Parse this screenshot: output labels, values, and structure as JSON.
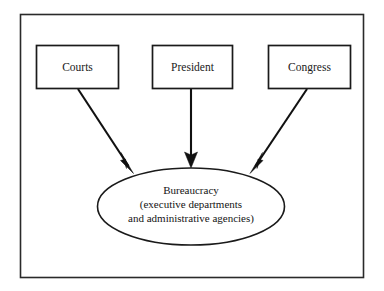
{
  "diagram": {
    "frame": {
      "name": "outer-border"
    },
    "nodes": [
      {
        "id": "courts",
        "label": "Courts",
        "shape": "rectangle",
        "x": 36,
        "y": 45,
        "width": 82,
        "height": 43
      },
      {
        "id": "president",
        "label": "President",
        "shape": "rectangle",
        "x": 152,
        "y": 45,
        "width": 80,
        "height": 43
      },
      {
        "id": "congress",
        "label": "Congress",
        "shape": "rectangle",
        "x": 268,
        "y": 45,
        "width": 82,
        "height": 43
      },
      {
        "id": "bureaucracy",
        "shape": "ellipse",
        "cx": 191,
        "cy": 206,
        "rx": 94,
        "ry": 39,
        "label_lines": [
          "Bureaucracy",
          "(executive departments",
          "and administrative agencies)"
        ]
      }
    ],
    "edges": [
      {
        "id": "courts-to-bureaucracy",
        "from": "courts",
        "to": "bureaucracy",
        "direction": "down-right",
        "x1": 78,
        "y1": 89,
        "x2": 133,
        "y2": 173
      },
      {
        "id": "president-to-bureaucracy",
        "from": "president",
        "to": "bureaucracy",
        "direction": "down",
        "x1": 191,
        "y1": 89,
        "x2": 191,
        "y2": 167
      },
      {
        "id": "congress-to-bureaucracy",
        "from": "congress",
        "to": "bureaucracy",
        "direction": "down-left",
        "x1": 307,
        "y1": 89,
        "x2": 250,
        "y2": 173
      }
    ],
    "colors": {
      "background": "#ffffff",
      "stroke": "#1a1a1a",
      "frame_stroke": "#2a2a2a",
      "text": "#141414"
    }
  }
}
